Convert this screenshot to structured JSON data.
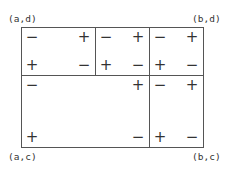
{
  "diagram": {
    "type": "partitioned-rectangle-sign-diagram",
    "corners": {
      "top_left": "(a,d)",
      "top_right": "(b,d)",
      "bottom_left": "(a,c)",
      "bottom_right": "(b,c)"
    },
    "cells": {
      "top_left": {
        "tl": "−",
        "tr": "+",
        "bl": "+",
        "br": "−"
      },
      "top_middle": {
        "tl": "−",
        "tr": "+",
        "bl": "+",
        "br": "−"
      },
      "top_right": {
        "tl": "−",
        "tr": "+",
        "bl": "+",
        "br": "−"
      },
      "bottom_left": {
        "tl": "−",
        "tr": "+",
        "bl": "+",
        "br": "−"
      },
      "bottom_right": {
        "tl": "−",
        "tr": "+",
        "bl": "+",
        "br": "−"
      }
    }
  }
}
